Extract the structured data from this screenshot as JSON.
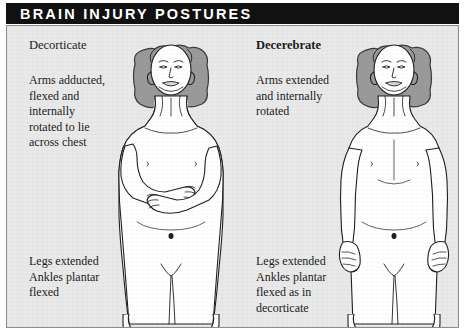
{
  "title": "BRAIN INJURY POSTURES",
  "colors": {
    "title_bar_bg": "#111111",
    "title_text": "#ffffff",
    "panel_bg": "#e9e9e9",
    "frame_border": "#8c8c8c",
    "skin_fill": "#ffffff",
    "outline": "#231f20",
    "pillow_fill": "#9a9a9a",
    "pillow_outline": "#3a3a3a",
    "text": "#1c1c1c"
  },
  "panels": [
    {
      "id": "decorticate",
      "heading": "Decorticate",
      "heading_bold": false,
      "upper_caption_lines": [
        "Arms adducted,",
        "flexed and",
        "internally",
        "rotated to lie",
        "across chest"
      ],
      "lower_caption_lines": [
        "Legs extended",
        "Ankles plantar",
        "flexed"
      ],
      "figure": {
        "name": "decorticate-posture-figure",
        "description": "Supine patient on a pillow with both arms flexed and folded across the chest, legs extended and ankles plantar flexed"
      }
    },
    {
      "id": "decerebrate",
      "heading": "Decerebrate",
      "heading_bold": true,
      "upper_caption_lines": [
        "Arms extended",
        "and internally",
        "rotated"
      ],
      "lower_caption_lines": [
        "Legs extended",
        "Ankles plantar",
        "flexed as in",
        "decorticate"
      ],
      "figure": {
        "name": "decerebrate-posture-figure",
        "description": "Supine patient on a pillow with both arms extended straight alongside the body and internally rotated, legs extended and ankles plantar flexed"
      }
    }
  ]
}
